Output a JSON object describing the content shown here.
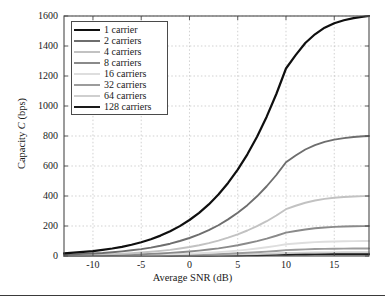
{
  "chart_data": {
    "type": "line",
    "title": "",
    "xlabel": "Average SNR (dB)",
    "ylabel": "Capacity C (bps)",
    "xlim": [
      -13,
      18.6
    ],
    "ylim": [
      0,
      1600
    ],
    "xticks": [
      -10,
      -5,
      0,
      5,
      10,
      15
    ],
    "yticks": [
      0,
      200,
      400,
      600,
      800,
      1000,
      1200,
      1400,
      1600
    ],
    "grid": true,
    "legend_position": "upper left",
    "x": [
      -13,
      -12,
      -11,
      -10,
      -9,
      -8,
      -7,
      -6,
      -5,
      -4,
      -3,
      -2,
      -1,
      0,
      1,
      2,
      3,
      4,
      5,
      6,
      7,
      8,
      9,
      10,
      11,
      12,
      13,
      14,
      15,
      16,
      17,
      18,
      18.6
    ],
    "series": [
      {
        "name": "1 carrier",
        "color": "#0f0f0f",
        "width": 2.2,
        "values": [
          18,
          22,
          27,
          33,
          41,
          50,
          61,
          75,
          92,
          112,
          136,
          165,
          199,
          240,
          288,
          344,
          410,
          487,
          576,
          678,
          795,
          929,
          1080,
          1250,
          1339,
          1420,
          1478,
          1522,
          1552,
          1572,
          1586,
          1595,
          1600
        ]
      },
      {
        "name": "2 carriers",
        "color": "#6e6e6e",
        "width": 1.9,
        "values": [
          9,
          11,
          14,
          17,
          20,
          25,
          31,
          38,
          46,
          56,
          68,
          82,
          100,
          120,
          144,
          172,
          205,
          244,
          288,
          339,
          398,
          465,
          540,
          625,
          670,
          710,
          739,
          761,
          776,
          786,
          793,
          798,
          800
        ]
      },
      {
        "name": "4 carriers",
        "color": "#c2c2c2",
        "width": 1.9,
        "values": [
          4.5,
          5.6,
          6.9,
          8.3,
          10.2,
          12.5,
          15.3,
          18.8,
          23,
          28,
          34,
          41,
          50,
          60,
          72,
          86,
          103,
          122,
          144,
          170,
          199,
          232,
          270,
          312,
          335,
          355,
          370,
          381,
          388,
          393,
          397,
          399,
          400
        ]
      },
      {
        "name": "8 carriers",
        "color": "#8a8a8a",
        "width": 1.9,
        "values": [
          2.2,
          2.8,
          3.4,
          4.2,
          5.1,
          6.2,
          7.6,
          9.4,
          11.5,
          14,
          17,
          21,
          25,
          30,
          36,
          43,
          51,
          61,
          72,
          85,
          99,
          116,
          135,
          156,
          167,
          177,
          185,
          190,
          194,
          197,
          198,
          199,
          200
        ]
      },
      {
        "name": "16 carriers",
        "color": "#dedede",
        "width": 1.9,
        "values": [
          1.1,
          1.4,
          1.7,
          2.1,
          2.6,
          3.1,
          3.8,
          4.7,
          5.8,
          7,
          8.5,
          10.3,
          12.5,
          15,
          18,
          21.5,
          25.6,
          30.4,
          36,
          42.4,
          49.7,
          58.1,
          67.5,
          78.1,
          83.7,
          88.8,
          92.4,
          95.1,
          97,
          98.3,
          99.1,
          99.7,
          100
        ]
      },
      {
        "name": "32 carriers",
        "color": "#9c9c9c",
        "width": 1.9,
        "values": [
          0.55,
          0.7,
          0.86,
          1.05,
          1.28,
          1.56,
          1.91,
          2.34,
          2.88,
          3.5,
          4.25,
          5.15,
          6.25,
          7.5,
          9,
          10.8,
          12.8,
          15.2,
          18,
          21.2,
          24.9,
          29,
          33.8,
          39.1,
          41.9,
          44.4,
          46.2,
          47.6,
          48.5,
          49.2,
          49.6,
          49.9,
          50
        ]
      },
      {
        "name": "64 carriers",
        "color": "#cfcfcf",
        "width": 1.9,
        "values": [
          0.28,
          0.35,
          0.43,
          0.52,
          0.64,
          0.78,
          0.96,
          1.17,
          1.44,
          1.75,
          2.13,
          2.58,
          3.13,
          3.75,
          4.5,
          5.4,
          6.4,
          7.6,
          9,
          10.6,
          12.4,
          14.5,
          16.9,
          19.5,
          20.9,
          22.2,
          23.1,
          23.8,
          24.3,
          24.6,
          24.8,
          24.9,
          25
        ]
      },
      {
        "name": "128 carriers",
        "color": "#1a1a1a",
        "width": 2.2,
        "values": [
          0.14,
          0.17,
          0.21,
          0.26,
          0.32,
          0.39,
          0.48,
          0.59,
          0.72,
          0.88,
          1.06,
          1.29,
          1.56,
          1.88,
          2.25,
          2.7,
          3.2,
          3.8,
          4.5,
          5.3,
          6.2,
          7.3,
          8.4,
          9.8,
          10.5,
          11.1,
          11.6,
          11.9,
          12.1,
          12.3,
          12.4,
          12.45,
          12.5
        ]
      }
    ]
  },
  "axes": {
    "xlabel": "Average SNR (dB)",
    "ylabel_prefix": "Capacity ",
    "ylabel_italic": "C",
    "ylabel_suffix": " (bps)",
    "xticklabels": [
      "-10",
      "-5",
      "0",
      "5",
      "10",
      "15"
    ],
    "yticklabels": [
      "0",
      "200",
      "400",
      "600",
      "800",
      "1000",
      "1200",
      "1400",
      "1600"
    ]
  },
  "legend": {
    "items": [
      {
        "label": "1 carrier",
        "color": "#0f0f0f",
        "width": 2.4
      },
      {
        "label": "2 carriers",
        "color": "#6e6e6e",
        "width": 2.0
      },
      {
        "label": "4 carriers",
        "color": "#c2c2c2",
        "width": 2.0
      },
      {
        "label": "8 carriers",
        "color": "#8a8a8a",
        "width": 2.0
      },
      {
        "label": "16 carriers",
        "color": "#dedede",
        "width": 2.0
      },
      {
        "label": "32 carriers",
        "color": "#9c9c9c",
        "width": 2.0
      },
      {
        "label": "64 carriers",
        "color": "#cfcfcf",
        "width": 2.0
      },
      {
        "label": "128 carriers",
        "color": "#1a1a1a",
        "width": 2.4
      }
    ]
  },
  "style": {
    "axis_color": "#4a4a4a",
    "grid_color": "#bdbdbd",
    "text_color": "#1a1a1a",
    "background": "#ffffff"
  }
}
